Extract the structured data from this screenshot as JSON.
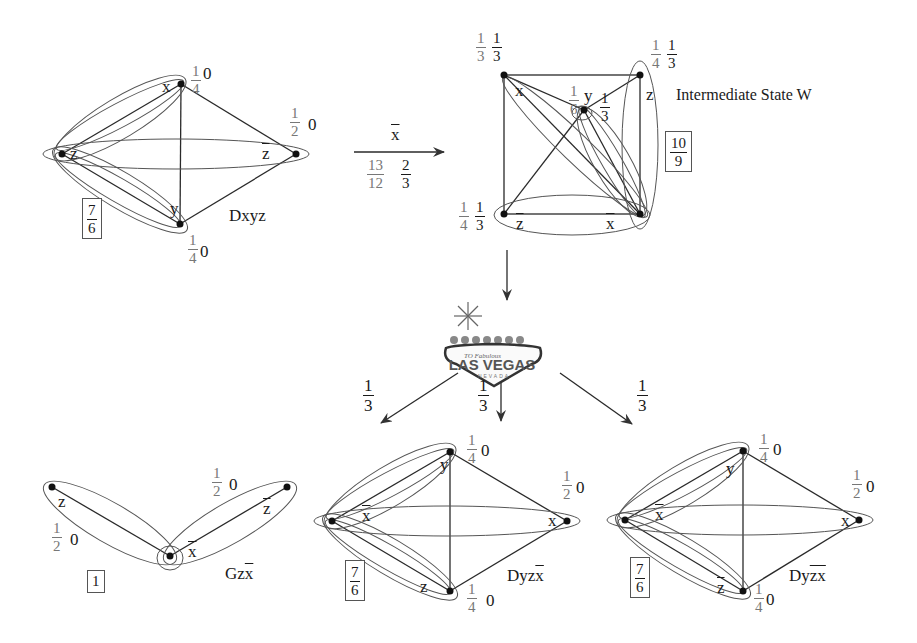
{
  "diagram": {
    "graphs": {
      "dxyz": {
        "name": "Dxyz",
        "nodes": {
          "x": "x",
          "y": "y",
          "z": "z",
          "zbar": "z"
        },
        "weights": {
          "x": {
            "num": "1",
            "den": "4",
            "val": "0"
          },
          "y": {
            "num": "1",
            "den": "4",
            "val": "0"
          },
          "zbar": {
            "num": "1",
            "den": "2",
            "val": "0"
          }
        },
        "boxed_value": {
          "num": "7",
          "den": "6"
        }
      },
      "intermediate": {
        "name": "Intermediate State W",
        "nodes": {
          "x": "x",
          "y": "y",
          "z": "z",
          "zbar": "z",
          "xbar": "x"
        },
        "weights": {
          "x": {
            "a_num": "1",
            "a_den": "3",
            "b_num": "1",
            "b_den": "3"
          },
          "y": {
            "a_num": "1",
            "a_den": "6",
            "b_num": "1",
            "b_den": "3"
          },
          "z": {
            "a_num": "1",
            "a_den": "4",
            "b_num": "1",
            "b_den": "3"
          },
          "zbar": {
            "a_num": "1",
            "a_den": "4",
            "b_num": "1",
            "b_den": "3"
          }
        },
        "boxed_value": {
          "num": "10",
          "den": "9"
        }
      },
      "gzx": {
        "name_prefix": "Gz",
        "name_overline": "x",
        "nodes": {
          "z": "z",
          "zbar": "z",
          "xbar": "x"
        },
        "weights": {
          "z": {
            "num": "1",
            "den": "2",
            "val": "0"
          },
          "zbar": {
            "num": "1",
            "den": "2",
            "val": "0"
          }
        },
        "boxed_value": "1"
      },
      "dyzx": {
        "name_prefix": "Dyz",
        "name_overline": "x",
        "nodes": {
          "y": "y",
          "z": "z",
          "x": "x",
          "xbar": "x"
        },
        "weights": {
          "y": {
            "num": "1",
            "den": "4",
            "val": "0"
          },
          "z": {
            "num": "1",
            "den": "4",
            "val": "0"
          },
          "x": {
            "num": "1",
            "den": "2",
            "val": "0"
          }
        },
        "boxed_value": {
          "num": "7",
          "den": "6"
        }
      },
      "dyzbarxbar": {
        "name_prefix": "Dy",
        "name_overline": "zx",
        "nodes": {
          "y": "y",
          "zbar": "z",
          "x": "x",
          "xbar": "x"
        },
        "weights": {
          "y": {
            "num": "1",
            "den": "4",
            "val": "0"
          },
          "zbar": {
            "num": "1",
            "den": "4",
            "val": "0"
          },
          "x": {
            "num": "1",
            "den": "2",
            "val": "0"
          }
        },
        "boxed_value": {
          "num": "7",
          "den": "6"
        }
      }
    },
    "transitions": {
      "main": {
        "label": "x",
        "left": {
          "num": "13",
          "den": "12"
        },
        "right": {
          "num": "2",
          "den": "3"
        }
      },
      "branches": [
        {
          "num": "1",
          "den": "3"
        },
        {
          "num": "1",
          "den": "3"
        },
        {
          "num": "1",
          "den": "3"
        }
      ]
    },
    "las_vegas_sign": {
      "top_text": "TO Fabulous",
      "main_text": "LAS VEGAS",
      "bottom_text": "NEVADA"
    }
  }
}
